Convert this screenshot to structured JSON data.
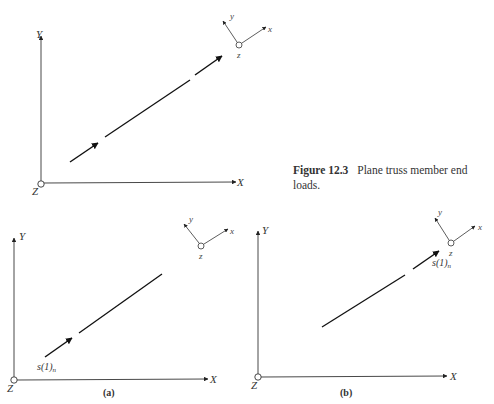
{
  "caption": {
    "figure_number": "Figure 12.3",
    "text": "Plane truss member end loads."
  },
  "global_axes": {
    "x": "X",
    "y": "Y",
    "z": "Z"
  },
  "local_axes": {
    "x": "x",
    "y": "y",
    "z": "z"
  },
  "panels": [
    {
      "id": "top",
      "label": "",
      "load_label": ""
    },
    {
      "id": "a",
      "label": "(a)",
      "load_label": "s(1)",
      "load_subscript": "n"
    },
    {
      "id": "b",
      "label": "(b)",
      "load_label": "s(1)",
      "load_subscript": "n"
    }
  ],
  "colors": {
    "line": "#222222",
    "text": "#333333",
    "background": "#ffffff"
  }
}
